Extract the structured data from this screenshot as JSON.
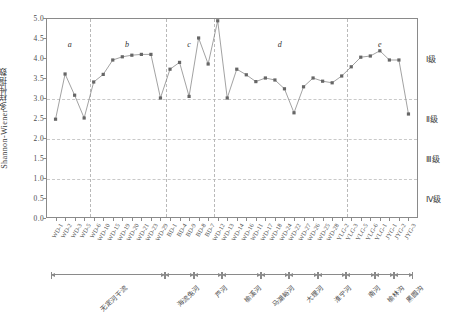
{
  "chart_data": {
    "type": "line",
    "title": "",
    "xlabel": "",
    "ylabel": "Shannon-Wiener多样性指数",
    "ylim": [
      0.0,
      5.0
    ],
    "ytick_labels": [
      "0.0",
      "0.5",
      "1.0",
      "1.5",
      "2.0",
      "2.5",
      "3.0",
      "3.5",
      "4.0",
      "4.5",
      "5.0"
    ],
    "ytick_values": [
      0.0,
      0.5,
      1.0,
      1.5,
      2.0,
      2.5,
      3.0,
      3.5,
      4.0,
      4.5,
      5.0
    ],
    "grid": "horizontal dashed at 1.0, 2.0, 3.0 (water-quality grade boundaries)",
    "gridline_values": [
      3.0,
      2.0,
      1.0
    ],
    "legend_position": "right margin, grade bands",
    "marker": "filled square",
    "series_color": "#666666",
    "line_color": "#8a8a8a",
    "categories": [
      "WD-1",
      "WD-2",
      "WD-3",
      "WD-5",
      "WD-6",
      "WD-10",
      "WD-15",
      "WD-19",
      "WD-20",
      "WD-21",
      "WD-23",
      "WD-29",
      "BD-1",
      "BD-4",
      "BD-9",
      "BD-8",
      "BD-7",
      "WD-12",
      "WD-13",
      "WD-14",
      "WD-16",
      "WD-11",
      "WD-17",
      "WD-18",
      "WD-24",
      "WD-22",
      "WD-27",
      "WD-26",
      "WD-25",
      "WD-28",
      "YLG-2",
      "YLG-3",
      "YLG-5",
      "YLG-6",
      "YLG-1",
      "JYG-1",
      "JYG-2",
      "JYG-3"
    ],
    "values": [
      2.47,
      3.6,
      3.07,
      2.5,
      3.4,
      3.59,
      3.95,
      4.03,
      4.07,
      4.09,
      4.09,
      3.0,
      3.72,
      3.89,
      3.04,
      4.5,
      3.85,
      4.93,
      3.0,
      3.72,
      3.58,
      3.41,
      3.5,
      3.45,
      3.23,
      2.63,
      3.28,
      3.5,
      3.42,
      3.38,
      3.55,
      3.78,
      4.02,
      4.05,
      4.18,
      3.95,
      3.95,
      2.6
    ],
    "group_dividers_after": [
      3,
      11,
      16,
      30
    ],
    "groups": [
      {
        "letter": "a",
        "start": 0,
        "end": 3
      },
      {
        "letter": "b",
        "start": 4,
        "end": 11
      },
      {
        "letter": "c",
        "start": 12,
        "end": 16
      },
      {
        "letter": "d",
        "start": 17,
        "end": 30
      },
      {
        "letter": "e",
        "start": 31,
        "end": 37
      }
    ],
    "grade_bands": [
      {
        "label": "Ⅰ级",
        "range": [
          3.0,
          5.0
        ]
      },
      {
        "label": "Ⅱ级",
        "range": [
          2.0,
          3.0
        ]
      },
      {
        "label": "Ⅲ级",
        "range": [
          1.0,
          2.0
        ]
      },
      {
        "label": "Ⅳ级",
        "range": [
          0.0,
          1.0
        ]
      }
    ],
    "regions": [
      {
        "name": "无定河干流",
        "start": 0,
        "end": 11
      },
      {
        "name": "海流兔河",
        "start": 12,
        "end": 14
      },
      {
        "name": "芦河",
        "start": 15,
        "end": 17
      },
      {
        "name": "榆溪河",
        "start": 18,
        "end": 21
      },
      {
        "name": "马湖峪河",
        "start": 22,
        "end": 24
      },
      {
        "name": "大理河",
        "start": 25,
        "end": 27
      },
      {
        "name": "淮宁河",
        "start": 28,
        "end": 30
      },
      {
        "name": "南河",
        "start": 31,
        "end": 33
      },
      {
        "name": "榆林沟",
        "start": 34,
        "end": 35
      },
      {
        "name": "黑圆沟",
        "start": 36,
        "end": 37
      }
    ]
  }
}
